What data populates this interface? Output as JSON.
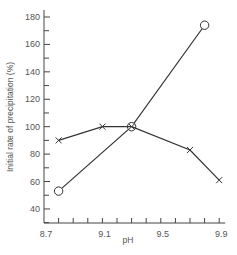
{
  "chart_data": {
    "type": "line",
    "title": "",
    "xlabel": "pH",
    "ylabel": "Initial rate of precipitation (%)",
    "xlim": [
      8.7,
      9.9
    ],
    "ylim": [
      30,
      185
    ],
    "x_ticks": [
      8.7,
      9.1,
      9.5,
      9.9
    ],
    "x_tick_labels": [
      "8.7",
      "9.1",
      "9.5",
      "9.9"
    ],
    "x_minor_step": 0.1,
    "y_ticks": [
      40,
      60,
      80,
      100,
      120,
      140,
      160,
      180
    ],
    "y_tick_labels": [
      "40",
      "60",
      "80",
      "100",
      "120",
      "140",
      "160",
      "180"
    ],
    "y_minor_step": 10,
    "grid": false,
    "legend": null,
    "series": [
      {
        "name": "circles",
        "marker": "circle",
        "x": [
          8.8,
          9.3,
          9.8
        ],
        "values": [
          53,
          100,
          174
        ]
      },
      {
        "name": "crosses",
        "marker": "x",
        "x": [
          8.8,
          9.1,
          9.3,
          9.7,
          9.9
        ],
        "values": [
          90,
          100,
          100,
          83,
          61
        ]
      }
    ]
  }
}
